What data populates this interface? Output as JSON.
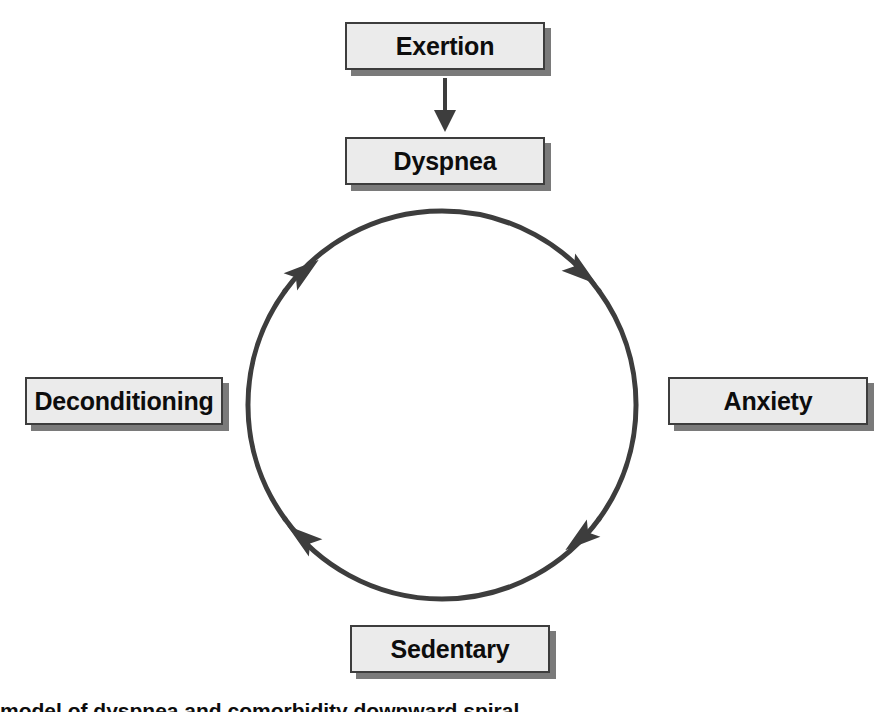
{
  "diagram": {
    "type": "cycle-flow-diagram",
    "background_color": "#ffffff",
    "box_fill_color": "#ebebeb",
    "box_border_color": "#3d3d3d",
    "box_shadow_color": "#7a7a7a",
    "line_color": "#3d3d3d",
    "text_color": "#0d0d0d",
    "cycle_direction": "clockwise",
    "nodes": [
      {
        "id": "exertion",
        "label": "Exertion"
      },
      {
        "id": "dyspnea",
        "label": "Dyspnea"
      },
      {
        "id": "anxiety",
        "label": "Anxiety"
      },
      {
        "id": "sedentary",
        "label": "Sedentary"
      },
      {
        "id": "deconditioning",
        "label": "Deconditioning"
      }
    ],
    "linear_arrow": {
      "from": "exertion",
      "to": "dyspnea",
      "direction": "down"
    },
    "cycle_arrows": [
      {
        "position": "top-right",
        "direction": "clockwise"
      },
      {
        "position": "bottom-right",
        "direction": "clockwise"
      },
      {
        "position": "bottom-left",
        "direction": "clockwise"
      },
      {
        "position": "top-left",
        "direction": "clockwise"
      }
    ]
  },
  "caption": {
    "text": "model of dyspnea and comorbidity downward spiral"
  }
}
